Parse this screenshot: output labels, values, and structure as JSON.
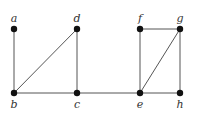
{
  "diagram": {
    "type": "graph",
    "nodes": [
      {
        "id": "a",
        "label": "a",
        "x": 14,
        "y": 29,
        "label_pos": "above"
      },
      {
        "id": "b",
        "label": "b",
        "x": 14,
        "y": 93,
        "label_pos": "below"
      },
      {
        "id": "c",
        "label": "c",
        "x": 77,
        "y": 93,
        "label_pos": "below"
      },
      {
        "id": "d",
        "label": "d",
        "x": 77,
        "y": 29,
        "label_pos": "above"
      },
      {
        "id": "e",
        "label": "e",
        "x": 140,
        "y": 93,
        "label_pos": "below"
      },
      {
        "id": "f",
        "label": "f",
        "x": 140,
        "y": 29,
        "label_pos": "above"
      },
      {
        "id": "g",
        "label": "g",
        "x": 180,
        "y": 29,
        "label_pos": "above"
      },
      {
        "id": "h",
        "label": "h",
        "x": 180,
        "y": 93,
        "label_pos": "below"
      }
    ],
    "edges": [
      [
        "a",
        "b"
      ],
      [
        "b",
        "c"
      ],
      [
        "b",
        "d"
      ],
      [
        "c",
        "d"
      ],
      [
        "c",
        "e"
      ],
      [
        "e",
        "f"
      ],
      [
        "e",
        "g"
      ],
      [
        "e",
        "h"
      ],
      [
        "f",
        "g"
      ],
      [
        "g",
        "h"
      ]
    ],
    "colors": {
      "edge": "#555555",
      "node": "#111111",
      "label": "#333333"
    }
  }
}
